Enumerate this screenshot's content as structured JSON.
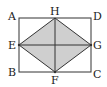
{
  "diagram": {
    "colors": {
      "stroke": "#333333",
      "fill": "#cfcfcf",
      "background": "#ffffff"
    },
    "points": {
      "A": {
        "label": "A",
        "x": 19,
        "y": 18
      },
      "D": {
        "label": "D",
        "x": 91,
        "y": 18
      },
      "B": {
        "label": "B",
        "x": 19,
        "y": 72
      },
      "C": {
        "label": "C",
        "x": 91,
        "y": 72
      },
      "H": {
        "label": "H",
        "x": 55,
        "y": 18
      },
      "F": {
        "label": "F",
        "x": 55,
        "y": 72
      },
      "E": {
        "label": "E",
        "x": 19,
        "y": 45
      },
      "G": {
        "label": "G",
        "x": 91,
        "y": 45
      }
    },
    "shapes": [
      {
        "type": "rectangle",
        "vertices": [
          "A",
          "B",
          "C",
          "D"
        ]
      },
      {
        "type": "rhombus",
        "vertices": [
          "E",
          "F",
          "G",
          "H"
        ],
        "shaded": true
      },
      {
        "type": "segment",
        "from": "E",
        "to": "G"
      },
      {
        "type": "segment",
        "from": "H",
        "to": "F"
      }
    ]
  }
}
